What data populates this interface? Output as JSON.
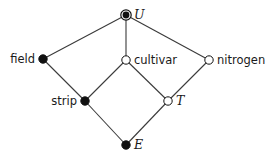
{
  "diagram": {
    "type": "Hasse diagram (factor structure)",
    "nodes": [
      {
        "id": "U",
        "label": "U",
        "x": 126,
        "y": 15,
        "style": "double-filled",
        "label_style": "italic",
        "label_side": "right"
      },
      {
        "id": "field",
        "label": "field",
        "x": 43,
        "y": 59,
        "style": "filled",
        "label_style": "sans",
        "label_side": "left"
      },
      {
        "id": "cultivar",
        "label": "cultivar",
        "x": 126,
        "y": 60,
        "style": "open",
        "label_style": "sans",
        "label_side": "right"
      },
      {
        "id": "nitrogen",
        "label": "nitrogen",
        "x": 209,
        "y": 60,
        "style": "open",
        "label_style": "sans",
        "label_side": "right"
      },
      {
        "id": "strip",
        "label": "strip",
        "x": 85,
        "y": 101,
        "style": "filled",
        "label_style": "sans",
        "label_side": "left"
      },
      {
        "id": "T",
        "label": "T",
        "x": 168,
        "y": 101,
        "style": "open",
        "label_style": "italic",
        "label_side": "right"
      },
      {
        "id": "E",
        "label": "E",
        "x": 126,
        "y": 145,
        "style": "filled",
        "label_style": "italic",
        "label_side": "right"
      }
    ],
    "edges": [
      [
        "U",
        "field"
      ],
      [
        "U",
        "cultivar"
      ],
      [
        "U",
        "nitrogen"
      ],
      [
        "field",
        "strip"
      ],
      [
        "cultivar",
        "strip"
      ],
      [
        "cultivar",
        "T"
      ],
      [
        "nitrogen",
        "T"
      ],
      [
        "strip",
        "E"
      ],
      [
        "T",
        "E"
      ]
    ],
    "colors": {
      "line": "#3a3a3a",
      "fill": "#111111",
      "open_fill": "#ffffff"
    }
  }
}
